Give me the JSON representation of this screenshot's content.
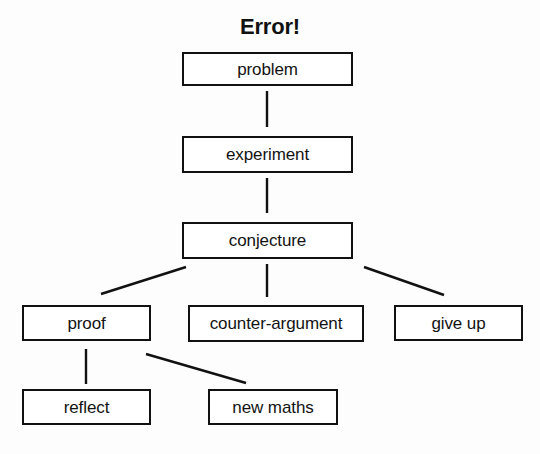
{
  "diagram": {
    "title": "Error!",
    "palette": {
      "background": "#fdfdfd",
      "ink": "#111111",
      "box_fill": "#ffffff"
    },
    "nodes": [
      {
        "id": "problem",
        "label": "problem",
        "x": 182,
        "y": 52,
        "w": 171,
        "h": 34
      },
      {
        "id": "experiment",
        "label": "experiment",
        "x": 182,
        "y": 136,
        "w": 171,
        "h": 37
      },
      {
        "id": "conjecture",
        "label": "conjecture",
        "x": 182,
        "y": 222,
        "w": 171,
        "h": 37
      },
      {
        "id": "proof",
        "label": "proof",
        "x": 22,
        "y": 305,
        "w": 129,
        "h": 36
      },
      {
        "id": "counter-argument",
        "label": "counter-argument",
        "x": 188,
        "y": 305,
        "w": 176,
        "h": 37
      },
      {
        "id": "give-up",
        "label": "give up",
        "x": 394,
        "y": 305,
        "w": 129,
        "h": 36
      },
      {
        "id": "reflect",
        "label": "reflect",
        "x": 22,
        "y": 389,
        "w": 129,
        "h": 36
      },
      {
        "id": "new-maths",
        "label": "new maths",
        "x": 208,
        "y": 389,
        "w": 130,
        "h": 36
      }
    ],
    "edges": [
      {
        "id": "problem-to-experiment",
        "from": "problem",
        "to": "experiment",
        "x1": 267,
        "y1": 91,
        "x2": 267,
        "y2": 127
      },
      {
        "id": "experiment-to-conjecture",
        "from": "experiment",
        "to": "conjecture",
        "x1": 267,
        "y1": 178,
        "x2": 267,
        "y2": 213
      },
      {
        "id": "conjecture-to-proof",
        "from": "conjecture",
        "to": "proof",
        "x1": 186,
        "y1": 267,
        "x2": 101,
        "y2": 294
      },
      {
        "id": "conjecture-to-counter",
        "from": "conjecture",
        "to": "counter-argument",
        "x1": 267,
        "y1": 264,
        "x2": 267,
        "y2": 297
      },
      {
        "id": "conjecture-to-give-up",
        "from": "conjecture",
        "to": "give-up",
        "x1": 364,
        "y1": 267,
        "x2": 444,
        "y2": 295
      },
      {
        "id": "proof-to-reflect",
        "from": "proof",
        "to": "reflect",
        "x1": 86,
        "y1": 349,
        "x2": 86,
        "y2": 384
      },
      {
        "id": "proof-to-new-maths",
        "from": "proof",
        "to": "new-maths",
        "x1": 146,
        "y1": 354,
        "x2": 246,
        "y2": 383
      }
    ]
  }
}
